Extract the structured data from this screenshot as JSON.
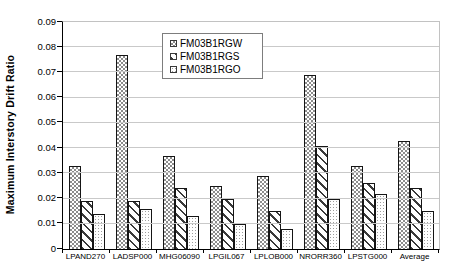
{
  "chart_data": {
    "type": "bar",
    "title": "",
    "xlabel": "",
    "ylabel": "Maximum Interstory Drift Ratio",
    "ylim": [
      0,
      0.09
    ],
    "ytick_step": 0.01,
    "ytick_labels": [
      "0",
      "0.01",
      "0.02",
      "0.03",
      "0.04",
      "0.05",
      "0.06",
      "0.07",
      "0.08",
      "0.09"
    ],
    "grid": true,
    "legend_position": "top-center-inside",
    "categories": [
      "LPAND270",
      "LADSP000",
      "MHG06090",
      "LPGIL067",
      "LPLOB000",
      "NRORR360",
      "LPSTG000",
      "Average"
    ],
    "series": [
      {
        "name": "FM03B1RGW",
        "pattern": "checker",
        "values": [
          0.033,
          0.077,
          0.037,
          0.025,
          0.029,
          0.069,
          0.033,
          0.043
        ]
      },
      {
        "name": "FM03B1RGS",
        "pattern": "hatch",
        "values": [
          0.019,
          0.019,
          0.024,
          0.02,
          0.015,
          0.041,
          0.026,
          0.024
        ]
      },
      {
        "name": "FM03B1RGO",
        "pattern": "dots",
        "values": [
          0.014,
          0.016,
          0.013,
          0.01,
          0.008,
          0.02,
          0.022,
          0.015
        ]
      }
    ]
  },
  "colors": {
    "background": "#ffffff",
    "bar_fill": "#ffffff",
    "bar_border": "#151515",
    "grid": "#c9c9c9",
    "axis": "#000000",
    "text": "#000000",
    "pattern_checker_ink": "#8c8c8c",
    "pattern_hatch_ink": "#3a3a3a",
    "pattern_dots_ink": "#9e9e9e"
  }
}
